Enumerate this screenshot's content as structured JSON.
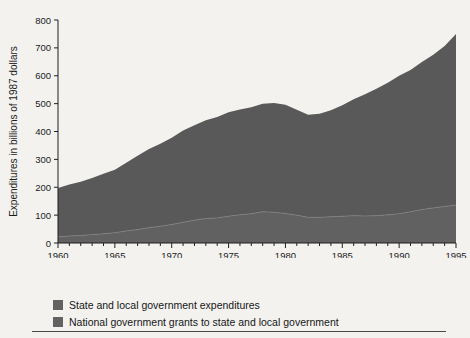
{
  "chart_data": {
    "type": "area",
    "stacked": true,
    "title": "",
    "xlabel": "Year",
    "ylabel": "Expenditures in billions of 1987 dollars",
    "xlim": [
      1960,
      1995
    ],
    "ylim": [
      0,
      800
    ],
    "ytick_labels": [
      "0",
      "100",
      "200",
      "300",
      "400",
      "500",
      "600",
      "700",
      "800"
    ],
    "ytick_values": [
      0,
      100,
      200,
      300,
      400,
      500,
      600,
      700,
      800
    ],
    "xtick_labels": [
      "1960",
      "1965",
      "1970",
      "1975",
      "1980",
      "1985",
      "1990",
      "1995"
    ],
    "xtick_values": [
      1960,
      1965,
      1970,
      1975,
      1980,
      1985,
      1990,
      1995
    ],
    "minor_xticks_interval": 1,
    "grid": false,
    "legend_position": "below-plot",
    "x": [
      1960,
      1961,
      1962,
      1963,
      1964,
      1965,
      1966,
      1967,
      1968,
      1969,
      1970,
      1971,
      1972,
      1973,
      1974,
      1975,
      1976,
      1977,
      1978,
      1979,
      1980,
      1981,
      1982,
      1983,
      1984,
      1985,
      1986,
      1987,
      1988,
      1989,
      1990,
      1991,
      1992,
      1993,
      1994,
      1995
    ],
    "series": [
      {
        "name": "National government grants to state and local government",
        "color": "#616161",
        "values": [
          22,
          25,
          27,
          30,
          33,
          37,
          43,
          48,
          55,
          60,
          66,
          74,
          82,
          88,
          90,
          96,
          101,
          105,
          112,
          110,
          106,
          100,
          92,
          92,
          94,
          96,
          98,
          97,
          98,
          101,
          105,
          112,
          120,
          126,
          131,
          136
        ]
      },
      {
        "name": "State and local government expenditures",
        "color": "#595959",
        "values": [
          175,
          185,
          193,
          203,
          215,
          226,
          245,
          265,
          282,
          296,
          312,
          330,
          340,
          352,
          362,
          373,
          378,
          382,
          388,
          392,
          390,
          378,
          368,
          372,
          382,
          398,
          418,
          437,
          455,
          474,
          495,
          509,
          529,
          549,
          576,
          614
        ]
      }
    ],
    "totals": [
      197,
      210,
      220,
      233,
      248,
      263,
      288,
      313,
      337,
      356,
      378,
      404,
      422,
      440,
      452,
      469,
      479,
      487,
      500,
      502,
      496,
      478,
      460,
      464,
      476,
      494,
      516,
      534,
      553,
      575,
      600,
      621,
      649,
      675,
      707,
      750
    ]
  },
  "legend": {
    "items": [
      {
        "label": "State and local government expenditures",
        "color": "#626262"
      },
      {
        "label": "National government grants to state and local government",
        "color": "#626262"
      }
    ]
  },
  "colors": {
    "background": "#f3f2ef",
    "area_top": "#595959",
    "area_bottom": "#616161",
    "axis": "#1f1f1f",
    "text": "#1b1b1b",
    "rule": "#4a4a4a"
  }
}
